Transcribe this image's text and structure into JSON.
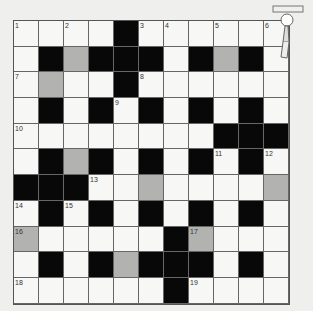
{
  "puzzle": {
    "rows": 11,
    "cols": 11,
    "legend": {
      "W": "white",
      "B": "black",
      "G": "shaded"
    },
    "grid": [
      [
        "W",
        "W",
        "W",
        "W",
        "B",
        "W",
        "W",
        "W",
        "W",
        "W",
        "W"
      ],
      [
        "W",
        "B",
        "G",
        "B",
        "B",
        "B",
        "W",
        "B",
        "G",
        "B",
        "W"
      ],
      [
        "W",
        "G",
        "W",
        "W",
        "B",
        "W",
        "W",
        "W",
        "W",
        "W",
        "W"
      ],
      [
        "W",
        "B",
        "W",
        "B",
        "W",
        "B",
        "W",
        "B",
        "W",
        "B",
        "W"
      ],
      [
        "W",
        "W",
        "W",
        "W",
        "W",
        "W",
        "W",
        "W",
        "B",
        "B",
        "B"
      ],
      [
        "W",
        "B",
        "G",
        "B",
        "W",
        "B",
        "W",
        "B",
        "W",
        "B",
        "W"
      ],
      [
        "B",
        "B",
        "B",
        "W",
        "W",
        "G",
        "W",
        "W",
        "W",
        "W",
        "G"
      ],
      [
        "W",
        "B",
        "W",
        "B",
        "W",
        "B",
        "W",
        "B",
        "W",
        "B",
        "W"
      ],
      [
        "G",
        "W",
        "W",
        "W",
        "W",
        "W",
        "B",
        "G",
        "W",
        "W",
        "W"
      ],
      [
        "W",
        "B",
        "W",
        "B",
        "G",
        "B",
        "B",
        "B",
        "W",
        "B",
        "W"
      ],
      [
        "W",
        "W",
        "W",
        "W",
        "W",
        "W",
        "B",
        "W",
        "W",
        "W",
        "W"
      ]
    ],
    "numbers": [
      {
        "r": 0,
        "c": 0,
        "n": "1"
      },
      {
        "r": 0,
        "c": 2,
        "n": "2"
      },
      {
        "r": 0,
        "c": 5,
        "n": "3"
      },
      {
        "r": 0,
        "c": 6,
        "n": "4"
      },
      {
        "r": 0,
        "c": 8,
        "n": "5"
      },
      {
        "r": 0,
        "c": 10,
        "n": "6"
      },
      {
        "r": 2,
        "c": 0,
        "n": "7"
      },
      {
        "r": 2,
        "c": 5,
        "n": "8"
      },
      {
        "r": 3,
        "c": 4,
        "n": "9"
      },
      {
        "r": 4,
        "c": 0,
        "n": "10"
      },
      {
        "r": 5,
        "c": 8,
        "n": "11"
      },
      {
        "r": 5,
        "c": 10,
        "n": "12"
      },
      {
        "r": 6,
        "c": 3,
        "n": "13"
      },
      {
        "r": 7,
        "c": 0,
        "n": "14"
      },
      {
        "r": 7,
        "c": 2,
        "n": "15"
      },
      {
        "r": 8,
        "c": 0,
        "n": "16"
      },
      {
        "r": 8,
        "c": 7,
        "n": "17"
      },
      {
        "r": 10,
        "c": 0,
        "n": "18"
      },
      {
        "r": 10,
        "c": 7,
        "n": "19"
      }
    ]
  },
  "decoration": {
    "icon": "cartoon-mascot-icon"
  }
}
